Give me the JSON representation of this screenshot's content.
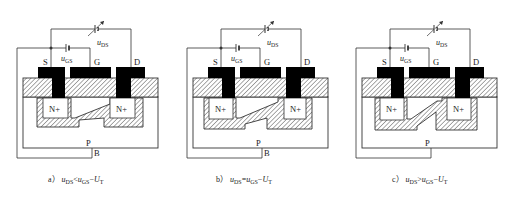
{
  "figure": {
    "panels": [
      {
        "id": "a",
        "offset_x": 0,
        "caption_prefix": "a）",
        "caption_lhs": "u",
        "caption_lhs_sub": "DS",
        "caption_op": "<",
        "caption_rhs": "u",
        "caption_rhs_sub": "GS",
        "caption_tail": "−U",
        "caption_tail_sub": "T",
        "terminal_labels": {
          "source": "S",
          "gate": "G",
          "drain": "D"
        },
        "region_labels": {
          "source_well": "N⁺",
          "drain_well": "N⁺",
          "substrate": "P",
          "body": "B"
        },
        "supply_labels": {
          "gs": "u",
          "gs_sub": "GS",
          "ds": "u",
          "ds_sub": "DS"
        },
        "channel_state": "continuous",
        "show_body_label": true
      },
      {
        "id": "b",
        "offset_x": 170,
        "caption_prefix": "b）",
        "caption_lhs": "u",
        "caption_lhs_sub": "DS",
        "caption_op": "=",
        "caption_rhs": "u",
        "caption_rhs_sub": "GS",
        "caption_tail": "−U",
        "caption_tail_sub": "T",
        "terminal_labels": {
          "source": "S",
          "gate": "G",
          "drain": "D"
        },
        "region_labels": {
          "source_well": "N⁺",
          "drain_well": "N⁺",
          "substrate": "P",
          "body": "B"
        },
        "supply_labels": {
          "gs": "u",
          "gs_sub": "GS",
          "ds": "u",
          "ds_sub": "DS"
        },
        "channel_state": "pinch-off at drain",
        "show_body_label": true
      },
      {
        "id": "c",
        "offset_x": 339,
        "caption_prefix": "c）",
        "caption_lhs": "u",
        "caption_lhs_sub": "DS",
        "caption_op": ">",
        "caption_rhs": "u",
        "caption_rhs_sub": "GS",
        "caption_tail": "−U",
        "caption_tail_sub": "T",
        "terminal_labels": {
          "source": "S",
          "gate": "G",
          "drain": "D"
        },
        "region_labels": {
          "source_well": "N⁺",
          "drain_well": "N⁺",
          "substrate": "P",
          "body": ""
        },
        "supply_labels": {
          "gs": "u",
          "gs_sub": "GS",
          "ds": "u",
          "ds_sub": "DS"
        },
        "channel_state": "pinch-off region extended",
        "show_body_label": false
      }
    ],
    "colors": {
      "line": "#333333",
      "metal": "#000000",
      "hatch": "#555555",
      "text": "#222222",
      "background": "#ffffff"
    }
  }
}
